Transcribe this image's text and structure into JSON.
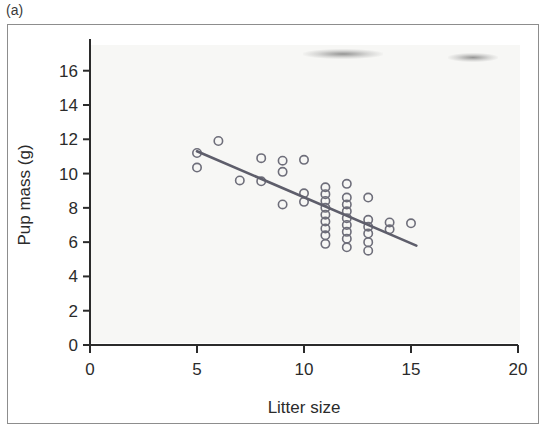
{
  "figure": {
    "panel_label": "(a)",
    "background_color": "#ffffff",
    "frame_color": "#8d8d8d"
  },
  "chart_data": {
    "type": "scatter",
    "title": "",
    "xlabel": "Litter size",
    "ylabel": "Pup mass (g)",
    "xlim": [
      0,
      20
    ],
    "ylim": [
      0,
      17.5
    ],
    "xticks": [
      0,
      5,
      10,
      15,
      20
    ],
    "xtick_labels": [
      "0",
      "5",
      "10",
      "15",
      "20"
    ],
    "yticks": [
      0,
      2,
      4,
      6,
      8,
      10,
      12,
      14,
      16
    ],
    "ytick_labels": [
      "0",
      "2",
      "4",
      "6",
      "8",
      "10",
      "12",
      "14",
      "16"
    ],
    "grid": false,
    "legend": null,
    "marker": "open-circle",
    "marker_color": "#6e6e7a",
    "marker_radius": 4.2,
    "points": [
      {
        "x": 5,
        "y": 11.2
      },
      {
        "x": 5,
        "y": 10.35
      },
      {
        "x": 6,
        "y": 11.9
      },
      {
        "x": 7,
        "y": 9.6
      },
      {
        "x": 8,
        "y": 10.9
      },
      {
        "x": 8,
        "y": 9.55
      },
      {
        "x": 9,
        "y": 10.75
      },
      {
        "x": 9,
        "y": 10.1
      },
      {
        "x": 9,
        "y": 8.2
      },
      {
        "x": 10,
        "y": 10.8
      },
      {
        "x": 10,
        "y": 8.85
      },
      {
        "x": 10,
        "y": 8.35
      },
      {
        "x": 11,
        "y": 9.2
      },
      {
        "x": 11,
        "y": 8.8
      },
      {
        "x": 11,
        "y": 8.4
      },
      {
        "x": 11,
        "y": 8.0
      },
      {
        "x": 11,
        "y": 7.6
      },
      {
        "x": 11,
        "y": 7.2
      },
      {
        "x": 11,
        "y": 6.8
      },
      {
        "x": 11,
        "y": 6.4
      },
      {
        "x": 11,
        "y": 5.9
      },
      {
        "x": 12,
        "y": 9.4
      },
      {
        "x": 12,
        "y": 8.6
      },
      {
        "x": 12,
        "y": 8.2
      },
      {
        "x": 12,
        "y": 7.8
      },
      {
        "x": 12,
        "y": 7.4
      },
      {
        "x": 12,
        "y": 7.0
      },
      {
        "x": 12,
        "y": 6.6
      },
      {
        "x": 12,
        "y": 6.2
      },
      {
        "x": 12,
        "y": 5.7
      },
      {
        "x": 13,
        "y": 8.6
      },
      {
        "x": 13,
        "y": 7.3
      },
      {
        "x": 13,
        "y": 6.9
      },
      {
        "x": 13,
        "y": 6.5
      },
      {
        "x": 13,
        "y": 6.0
      },
      {
        "x": 13,
        "y": 5.5
      },
      {
        "x": 14,
        "y": 7.15
      },
      {
        "x": 14,
        "y": 6.75
      },
      {
        "x": 15,
        "y": 7.1
      }
    ],
    "trend_line": {
      "type": "linear-fit",
      "color": "#5e5e6b",
      "x_start": 5.0,
      "y_start": 11.3,
      "x_end": 15.25,
      "y_end": 5.8
    }
  }
}
